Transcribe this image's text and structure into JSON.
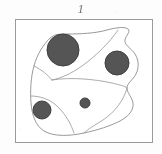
{
  "figure": {
    "label": "1",
    "label_semantic": "figure-number-1",
    "caption": ""
  },
  "colors": {
    "page_background": "#fdfdfd",
    "frame_stroke": "#9a9a9a",
    "outline_stroke": "#8d8d8d",
    "internal_line_stroke": "#9c9c9c",
    "circle_fill": "#555555",
    "circle_stroke": "#3f3f3f",
    "label_text": "#6d6d6d"
  },
  "frame": {
    "name": "plate-border",
    "x": 15,
    "y": 19,
    "width": 138,
    "height": 124,
    "stroke_width": 1
  },
  "diagram": {
    "name": "thin-section-sketch",
    "outline_path": "M 50 38 C 44 44 37 54 34 66 C 31 76 30 90 31 103 C 32 116 36 126 44 131 C 54 137 70 136 84 133 C 98 130 110 126 120 121 C 129 116 134 110 133 103 C 132 97 127 93 127 88 C 127 83 133 80 136 74 C 139 68 139 60 135 54 C 131 48 124 45 125 40 C 126 35 131 32 128 29 C 124 26 114 28 103 31 C 90 34 74 34 64 34 C 57 34 54 35 50 38 Z",
    "internal_lines": [
      {
        "name": "division-line-upper-right",
        "path": "M 118 30 C 110 42 96 56 82 66 C 72 73 62 78 52 80"
      },
      {
        "name": "division-line-left-wedge",
        "path": "M 34 66 C 42 70 48 75 52 80"
      },
      {
        "name": "division-line-horizontal",
        "path": "M 52 80 C 70 77 94 79 112 83 C 120 85 125 86 127 88"
      },
      {
        "name": "division-line-lower-left",
        "path": "M 31 96 C 40 96 50 99 58 107 C 66 115 71 124 74 133"
      },
      {
        "name": "division-line-right-edge",
        "path": "M 127 88 C 124 100 115 112 103 120 C 95 125 88 129 84 133"
      }
    ],
    "circles": [
      {
        "name": "grain-large-upper-left",
        "cx": 63,
        "cy": 50,
        "r": 16,
        "size_label": "large"
      },
      {
        "name": "grain-medium-upper-right",
        "cx": 117,
        "cy": 63,
        "r": 12,
        "size_label": "medium"
      },
      {
        "name": "grain-small-lower-left",
        "cx": 42,
        "cy": 110,
        "r": 9,
        "size_label": "small"
      },
      {
        "name": "grain-tiny-center",
        "cx": 85,
        "cy": 103,
        "r": 5,
        "size_label": "tiny"
      }
    ]
  },
  "chart_data": {
    "type": "scatter",
    "title": "1",
    "xlabel": "",
    "ylabel": "",
    "xlim": [
      15,
      153
    ],
    "ylim": [
      19,
      143
    ],
    "grid": false,
    "legend": null,
    "series": [
      {
        "name": "grains",
        "points": [
          {
            "x": 63,
            "y": 50,
            "r": 16
          },
          {
            "x": 117,
            "y": 63,
            "r": 12
          },
          {
            "x": 42,
            "y": 110,
            "r": 9
          },
          {
            "x": 85,
            "y": 103,
            "r": 5
          }
        ]
      }
    ],
    "annotations": [
      {
        "text": "1",
        "x": 84,
        "y": 9
      }
    ]
  }
}
